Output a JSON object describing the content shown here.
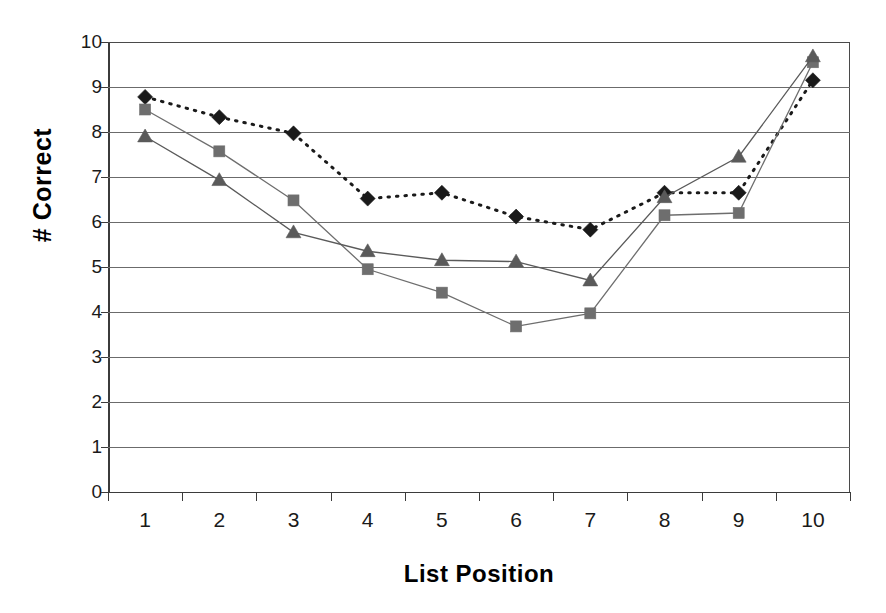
{
  "chart_data": {
    "type": "line",
    "title": "",
    "xlabel": "List Position",
    "ylabel": "# Correct",
    "categories": [
      1,
      2,
      3,
      4,
      5,
      6,
      7,
      8,
      9,
      10
    ],
    "x_tick_labels": [
      "1",
      "2",
      "3",
      "4",
      "5",
      "6",
      "7",
      "8",
      "9",
      "10"
    ],
    "y_tick_labels": [
      "0",
      "1",
      "2",
      "3",
      "4",
      "5",
      "6",
      "7",
      "8",
      "9",
      "10"
    ],
    "ylim": [
      0,
      10
    ],
    "y_tick_step": 1,
    "grid": "horizontal",
    "legend": "none",
    "series": [
      {
        "name": "diamond-series",
        "marker": "diamond",
        "line_style": "dotted",
        "line_width": 3,
        "color": "#1a1a1a",
        "values": [
          8.78,
          8.33,
          7.97,
          6.52,
          6.65,
          6.12,
          5.83,
          6.65,
          6.65,
          9.15
        ]
      },
      {
        "name": "square-series",
        "marker": "square",
        "line_style": "solid",
        "line_width": 1.3,
        "color": "#6e6e6e",
        "values": [
          8.5,
          7.57,
          6.48,
          4.95,
          4.43,
          3.68,
          3.97,
          6.15,
          6.2,
          9.55
        ]
      },
      {
        "name": "triangle-series",
        "marker": "triangle",
        "line_style": "solid",
        "line_width": 1.3,
        "color": "#5a5a5a",
        "values": [
          7.9,
          6.93,
          5.77,
          5.35,
          5.15,
          5.12,
          4.7,
          6.55,
          7.45,
          9.68
        ]
      }
    ]
  },
  "axes": {
    "y_title": "# Correct",
    "x_title": "List Position"
  }
}
